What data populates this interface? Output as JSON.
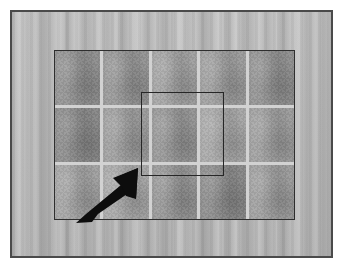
{
  "scene": {
    "title": "Tiled surface close-up with annotation",
    "description": "Photograph of a gray tiled wall surface inside a rectangular frame, with a square region-of-interest outline and a black arrow indicating a specific tile."
  },
  "frame": {
    "name": "photo-frame",
    "border_color": "#4a4a4a",
    "background_color": "#b6b6b6"
  },
  "background": {
    "name": "wall-texture",
    "kind": "vertical-streaked-panel",
    "base_color": "#b6b6b6",
    "highlight_color": "#cfcfcf",
    "shadow_color": "#9d9d9d"
  },
  "tiled_region": {
    "name": "tiled-region",
    "border_color": "#2e2e2e",
    "grout_color": "#d2d2d2",
    "columns": 5,
    "rows": 3,
    "tile_base_color": "#949494",
    "tiles": [
      {
        "row": 1,
        "col": 1,
        "tone": "tone-a",
        "color": "#8d8d8d"
      },
      {
        "row": 1,
        "col": 2,
        "tone": "tone-c",
        "color": "#929292"
      },
      {
        "row": 1,
        "col": 3,
        "tone": "tone-d",
        "color": "#9f9f9f"
      },
      {
        "row": 1,
        "col": 4,
        "tone": "tone-b",
        "color": "#9a9a9a"
      },
      {
        "row": 1,
        "col": 5,
        "tone": "tone-a",
        "color": "#8d8d8d"
      },
      {
        "row": 2,
        "col": 1,
        "tone": "tone-e",
        "color": "#868686"
      },
      {
        "row": 2,
        "col": 2,
        "tone": "tone-b",
        "color": "#9a9a9a"
      },
      {
        "row": 2,
        "col": 3,
        "tone": "tone-c",
        "color": "#929292"
      },
      {
        "row": 2,
        "col": 4,
        "tone": "tone-f",
        "color": "#a4a4a4"
      },
      {
        "row": 2,
        "col": 5,
        "tone": "tone-b",
        "color": "#9a9a9a"
      },
      {
        "row": 3,
        "col": 1,
        "tone": "tone-d",
        "color": "#9f9f9f"
      },
      {
        "row": 3,
        "col": 2,
        "tone": "tone-f",
        "color": "#a4a4a4"
      },
      {
        "row": 3,
        "col": 3,
        "tone": "tone-c",
        "color": "#929292"
      },
      {
        "row": 3,
        "col": 4,
        "tone": "tone-e",
        "color": "#868686"
      },
      {
        "row": 3,
        "col": 5,
        "tone": "tone-b",
        "color": "#9a9a9a"
      }
    ]
  },
  "highlight_square": {
    "name": "region-of-interest",
    "border_color": "#262626",
    "fill": "none"
  },
  "arrow": {
    "name": "pointer-arrow",
    "color": "#0d0d0d",
    "direction": "northeast"
  }
}
